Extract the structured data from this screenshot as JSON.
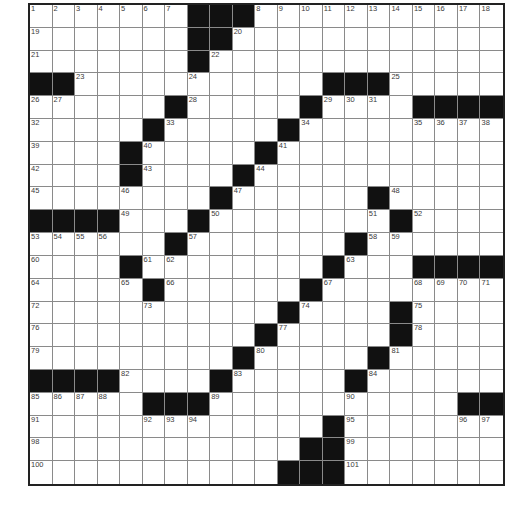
{
  "puzzle": {
    "rows": 21,
    "cols": 21,
    "grid": [
      "WWWWWWWBBBWWWWWWWWWWW",
      "WWWWWWWBBWWWWWWWWWWWW",
      "WWWWWWWBWWWWWWWWWWWWW",
      "BBWWWWWWWWWWWBBBWWWWW",
      "WWWWWWBWWWWWBWWWWBBBB",
      "WWWWWBWWWWWBWWWWWWWWW",
      "WWWWBWWWWWBWWWWWWWWWW",
      "WWWWBWWWWBWWWWWWWWWWW",
      "WWWWWWWWBWWWWWWBWWWWW",
      "BBBBWWWBWWWWWWWWBWWWW",
      "WWWWWWBWWWWWWWBWWWWWW",
      "WWWWBWWWWWWWWBWWWBBBB",
      "WWWWWBWWWWWWBWWWWWWWW",
      "WWWWWWWWWWWBWWWWBWWWW",
      "WWWWWWWWWWBWWWWWBWWWW",
      "WWWWWWWWWBWWWWWBWWWWW",
      "BBBBWWWWBWWWWWBWWWWWW",
      "WWWWWBBBWWWWWWWWWWWBB",
      "WWWWWWWWWWWWWBWWWWWWW",
      "WWWWWWWWWWWWBBWWWWWWW",
      "WWWWWWWWWWWBBBWWWWWWW"
    ],
    "numbers": [
      {
        "r": 0,
        "c": 0,
        "n": "1"
      },
      {
        "r": 0,
        "c": 1,
        "n": "2"
      },
      {
        "r": 0,
        "c": 2,
        "n": "3"
      },
      {
        "r": 0,
        "c": 3,
        "n": "4"
      },
      {
        "r": 0,
        "c": 4,
        "n": "5"
      },
      {
        "r": 0,
        "c": 5,
        "n": "6"
      },
      {
        "r": 0,
        "c": 6,
        "n": "7"
      },
      {
        "r": 0,
        "c": 10,
        "n": "8"
      },
      {
        "r": 0,
        "c": 11,
        "n": "9"
      },
      {
        "r": 0,
        "c": 12,
        "n": "10"
      },
      {
        "r": 0,
        "c": 13,
        "n": "11"
      },
      {
        "r": 0,
        "c": 14,
        "n": "12"
      },
      {
        "r": 0,
        "c": 15,
        "n": "13"
      },
      {
        "r": 0,
        "c": 16,
        "n": "14"
      },
      {
        "r": 0,
        "c": 17,
        "n": "15"
      },
      {
        "r": 0,
        "c": 18,
        "n": "16"
      },
      {
        "r": 0,
        "c": 19,
        "n": "17"
      },
      {
        "r": 0,
        "c": 20,
        "n": "18"
      },
      {
        "r": 1,
        "c": 0,
        "n": "19"
      },
      {
        "r": 1,
        "c": 9,
        "n": "20"
      },
      {
        "r": 2,
        "c": 0,
        "n": "21"
      },
      {
        "r": 2,
        "c": 8,
        "n": "22"
      },
      {
        "r": 3,
        "c": 2,
        "n": "23"
      },
      {
        "r": 3,
        "c": 7,
        "n": "24"
      },
      {
        "r": 3,
        "c": 16,
        "n": "25"
      },
      {
        "r": 4,
        "c": 0,
        "n": "26"
      },
      {
        "r": 4,
        "c": 1,
        "n": "27"
      },
      {
        "r": 4,
        "c": 7,
        "n": "28"
      },
      {
        "r": 4,
        "c": 13,
        "n": "29"
      },
      {
        "r": 4,
        "c": 14,
        "n": "30"
      },
      {
        "r": 4,
        "c": 15,
        "n": "31"
      },
      {
        "r": 5,
        "c": 0,
        "n": "32"
      },
      {
        "r": 5,
        "c": 6,
        "n": "33"
      },
      {
        "r": 5,
        "c": 12,
        "n": "34"
      },
      {
        "r": 5,
        "c": 17,
        "n": "35"
      },
      {
        "r": 5,
        "c": 18,
        "n": "36"
      },
      {
        "r": 5,
        "c": 19,
        "n": "37"
      },
      {
        "r": 5,
        "c": 20,
        "n": "38"
      },
      {
        "r": 6,
        "c": 0,
        "n": "39"
      },
      {
        "r": 6,
        "c": 5,
        "n": "40"
      },
      {
        "r": 6,
        "c": 11,
        "n": "41"
      },
      {
        "r": 7,
        "c": 0,
        "n": "42"
      },
      {
        "r": 7,
        "c": 5,
        "n": "43"
      },
      {
        "r": 7,
        "c": 10,
        "n": "44"
      },
      {
        "r": 8,
        "c": 0,
        "n": "45"
      },
      {
        "r": 8,
        "c": 4,
        "n": "46"
      },
      {
        "r": 8,
        "c": 9,
        "n": "47"
      },
      {
        "r": 8,
        "c": 16,
        "n": "48"
      },
      {
        "r": 9,
        "c": 4,
        "n": "49"
      },
      {
        "r": 9,
        "c": 8,
        "n": "50"
      },
      {
        "r": 9,
        "c": 15,
        "n": "51"
      },
      {
        "r": 9,
        "c": 17,
        "n": "52"
      },
      {
        "r": 10,
        "c": 0,
        "n": "53"
      },
      {
        "r": 10,
        "c": 1,
        "n": "54"
      },
      {
        "r": 10,
        "c": 2,
        "n": "55"
      },
      {
        "r": 10,
        "c": 3,
        "n": "56"
      },
      {
        "r": 10,
        "c": 7,
        "n": "57"
      },
      {
        "r": 10,
        "c": 15,
        "n": "58"
      },
      {
        "r": 10,
        "c": 16,
        "n": "59"
      },
      {
        "r": 11,
        "c": 0,
        "n": "60"
      },
      {
        "r": 11,
        "c": 5,
        "n": "61"
      },
      {
        "r": 11,
        "c": 6,
        "n": "62"
      },
      {
        "r": 11,
        "c": 14,
        "n": "63"
      },
      {
        "r": 12,
        "c": 0,
        "n": "64"
      },
      {
        "r": 12,
        "c": 4,
        "n": "65"
      },
      {
        "r": 12,
        "c": 6,
        "n": "66"
      },
      {
        "r": 12,
        "c": 13,
        "n": "67"
      },
      {
        "r": 12,
        "c": 17,
        "n": "68"
      },
      {
        "r": 12,
        "c": 18,
        "n": "69"
      },
      {
        "r": 12,
        "c": 19,
        "n": "70"
      },
      {
        "r": 12,
        "c": 20,
        "n": "71"
      },
      {
        "r": 13,
        "c": 0,
        "n": "72"
      },
      {
        "r": 13,
        "c": 5,
        "n": "73"
      },
      {
        "r": 13,
        "c": 12,
        "n": "74"
      },
      {
        "r": 13,
        "c": 17,
        "n": "75"
      },
      {
        "r": 14,
        "c": 0,
        "n": "76"
      },
      {
        "r": 14,
        "c": 11,
        "n": "77"
      },
      {
        "r": 14,
        "c": 17,
        "n": "78"
      },
      {
        "r": 15,
        "c": 0,
        "n": "79"
      },
      {
        "r": 15,
        "c": 10,
        "n": "80"
      },
      {
        "r": 15,
        "c": 16,
        "n": "81"
      },
      {
        "r": 16,
        "c": 4,
        "n": "82"
      },
      {
        "r": 16,
        "c": 9,
        "n": "83"
      },
      {
        "r": 16,
        "c": 15,
        "n": "84"
      },
      {
        "r": 17,
        "c": 0,
        "n": "85"
      },
      {
        "r": 17,
        "c": 1,
        "n": "86"
      },
      {
        "r": 17,
        "c": 2,
        "n": "87"
      },
      {
        "r": 17,
        "c": 3,
        "n": "88"
      },
      {
        "r": 17,
        "c": 8,
        "n": "89"
      },
      {
        "r": 17,
        "c": 14,
        "n": "90"
      },
      {
        "r": 18,
        "c": 0,
        "n": "91"
      },
      {
        "r": 18,
        "c": 5,
        "n": "92"
      },
      {
        "r": 18,
        "c": 6,
        "n": "93"
      },
      {
        "r": 18,
        "c": 7,
        "n": "94"
      },
      {
        "r": 18,
        "c": 14,
        "n": "95"
      },
      {
        "r": 18,
        "c": 19,
        "n": "96"
      },
      {
        "r": 18,
        "c": 20,
        "n": "97"
      },
      {
        "r": 19,
        "c": 0,
        "n": "98"
      },
      {
        "r": 19,
        "c": 14,
        "n": "99"
      },
      {
        "r": 20,
        "c": 0,
        "n": "100"
      },
      {
        "r": 20,
        "c": 14,
        "n": "101"
      }
    ],
    "colors": {
      "block": "#111111",
      "cell": "#ffffff",
      "gridline": "#8a8a8a",
      "border": "#222222",
      "number": "#3a3a3a"
    }
  }
}
